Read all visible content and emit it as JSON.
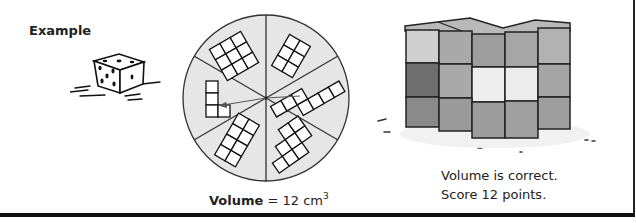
{
  "example": {
    "label": "Example",
    "die": {
      "icon": "die-icon",
      "faces_visible": [
        5,
        5,
        1
      ]
    }
  },
  "spinner": {
    "sections": 6,
    "fill_color": "#e6e6e6",
    "arrow_points_to": "L-shape section",
    "volume_label_bold": "Volume",
    "volume_equals": " = 12 cm",
    "volume_unit_exponent": "3"
  },
  "cube_model": {
    "description": "3D cube model with 12 cubes",
    "colors": {
      "light": "#cfcfcf",
      "mid": "#a9a9a9",
      "dark": "#6e6e6e",
      "highlight": "#eeeeee"
    }
  },
  "result": {
    "line1": "Volume is correct.",
    "line2": "Score 12 points."
  }
}
